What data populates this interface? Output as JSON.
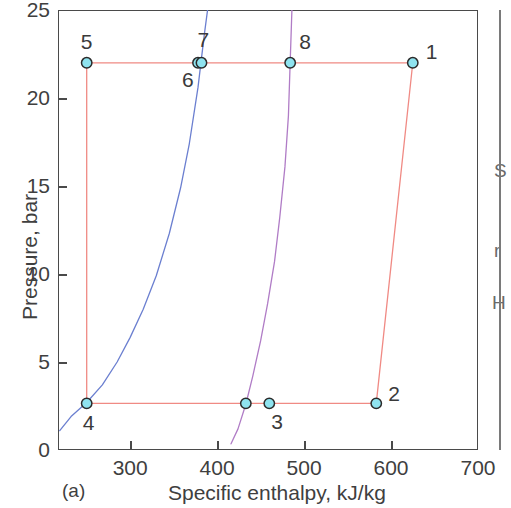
{
  "figure": {
    "panel_caption": "(a)",
    "background": "#ffffff"
  },
  "chart_data": {
    "type": "line",
    "title": "",
    "xlabel": "Specific enthalpy, kJ/kg",
    "ylabel": "Pressure, bar",
    "xlim": [
      217,
      700
    ],
    "ylim": [
      0,
      25
    ],
    "xticks": [
      300,
      400,
      500,
      600,
      700
    ],
    "yticks": [
      0,
      5,
      10,
      15,
      20,
      25
    ],
    "xtick_labels": [
      "300",
      "400",
      "500",
      "600",
      "700"
    ],
    "ytick_labels": [
      "0",
      "5",
      "10",
      "15",
      "20",
      "25"
    ],
    "grid": false,
    "legend": null,
    "colors": {
      "cycle_line": "#f08a84",
      "saturated_liquid_line": "#6b7fd0",
      "saturated_vapor_line": "#b07cc6",
      "marker_fill": "#8fe3ef",
      "marker_edge": "#2b2b2b",
      "axis": "#4a4a4a"
    },
    "series": [
      {
        "name": "Refrigeration cycle (state path)",
        "color": "#f08a84",
        "type": "line",
        "points": [
          {
            "h": 625,
            "p": 22.0
          },
          {
            "h": 583,
            "p": 2.65
          },
          {
            "h": 433,
            "p": 2.65
          },
          {
            "h": 250,
            "p": 2.65
          },
          {
            "h": 250,
            "p": 22.0
          },
          {
            "h": 380,
            "p": 22.0
          },
          {
            "h": 484,
            "p": 22.0
          },
          {
            "h": 625,
            "p": 22.0
          }
        ]
      },
      {
        "name": "Saturated liquid line",
        "color": "#6b7fd0",
        "type": "line",
        "points": [
          {
            "h": 219,
            "p": 1.1
          },
          {
            "h": 232,
            "p": 1.9
          },
          {
            "h": 250,
            "p": 2.7
          },
          {
            "h": 268,
            "p": 3.7
          },
          {
            "h": 285,
            "p": 5.0
          },
          {
            "h": 300,
            "p": 6.4
          },
          {
            "h": 315,
            "p": 8.0
          },
          {
            "h": 330,
            "p": 9.9
          },
          {
            "h": 345,
            "p": 12.3
          },
          {
            "h": 358,
            "p": 14.9
          },
          {
            "h": 368,
            "p": 17.4
          },
          {
            "h": 378,
            "p": 20.6
          },
          {
            "h": 385,
            "p": 23.5
          },
          {
            "h": 389,
            "p": 25.0
          }
        ]
      },
      {
        "name": "Saturated vapor line",
        "color": "#b07cc6",
        "type": "line",
        "points": [
          {
            "h": 416,
            "p": 0.35
          },
          {
            "h": 424,
            "p": 1.2
          },
          {
            "h": 433,
            "p": 2.6
          },
          {
            "h": 441,
            "p": 4.2
          },
          {
            "h": 450,
            "p": 6.2
          },
          {
            "h": 458,
            "p": 8.3
          },
          {
            "h": 466,
            "p": 10.7
          },
          {
            "h": 472,
            "p": 13.2
          },
          {
            "h": 478,
            "p": 16.1
          },
          {
            "h": 482,
            "p": 19.0
          },
          {
            "h": 484,
            "p": 22.0
          },
          {
            "h": 486,
            "p": 25.0
          }
        ]
      }
    ],
    "markers": [
      {
        "label": "1",
        "h": 625,
        "p": 22.0,
        "label_dx": 13,
        "label_dy": -22
      },
      {
        "label": "2",
        "h": 583,
        "p": 2.65,
        "label_dx": 12,
        "label_dy": -20
      },
      {
        "label": "3",
        "h": 460,
        "p": 2.65,
        "label_dx": 2,
        "label_dy": 8
      },
      {
        "label": "",
        "h": 433,
        "p": 2.65,
        "label_dx": 0,
        "label_dy": 0
      },
      {
        "label": "4",
        "h": 250,
        "p": 2.65,
        "label_dx": -4,
        "label_dy": 9
      },
      {
        "label": "5",
        "h": 250,
        "p": 22.0,
        "label_dx": -6,
        "label_dy": -32
      },
      {
        "label": "6",
        "h": 378,
        "p": 22.0,
        "label_dx": -16,
        "label_dy": 6
      },
      {
        "label": "7",
        "h": 382,
        "p": 22.0,
        "label_dx": -4,
        "label_dy": -34
      },
      {
        "label": "8",
        "h": 484,
        "p": 22.0,
        "label_dx": 9,
        "label_dy": -32
      }
    ]
  },
  "right_edge_fragments": [
    "S",
    "r",
    "H"
  ]
}
